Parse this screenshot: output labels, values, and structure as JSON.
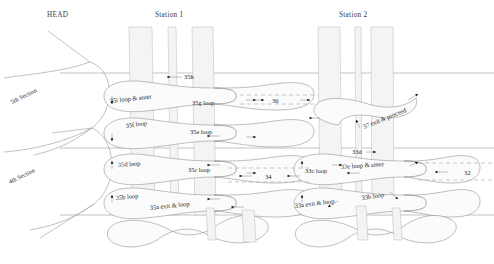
{
  "diagram": {
    "title_row": {
      "head": "HEAD",
      "station1": "Station 1",
      "station2": "Station 2"
    },
    "sections": [
      {
        "id": "sec5",
        "label": "5th Section"
      },
      {
        "id": "sec4",
        "label": "4th Section"
      }
    ],
    "station1_labels": [
      {
        "id": "s35h",
        "text": "35h"
      },
      {
        "id": "s35i",
        "text": "35i  loop & enter"
      },
      {
        "id": "s35g",
        "text": "35g  loop"
      },
      {
        "id": "s35f",
        "text": "35f  loop"
      },
      {
        "id": "s35e",
        "text": "35e  loop"
      },
      {
        "id": "s35d",
        "text": "35d  loop"
      },
      {
        "id": "s35c",
        "text": "35c  loop"
      },
      {
        "id": "s35b",
        "text": "35b  loop"
      },
      {
        "id": "s35a",
        "text": "35a  exit & loop"
      }
    ],
    "station2_labels": [
      {
        "id": "s37",
        "text": "37 exit & proceed"
      },
      {
        "id": "s33d",
        "text": "33d"
      },
      {
        "id": "s33c",
        "text": "33c loop"
      },
      {
        "id": "s33e",
        "text": "33e  loop & enter"
      },
      {
        "id": "s33b",
        "text": "33b  loop"
      },
      {
        "id": "s33a",
        "text": "33a  exit & loop"
      }
    ],
    "connectors": [
      {
        "id": "c36",
        "text": "36"
      },
      {
        "id": "c34",
        "text": "34"
      },
      {
        "id": "c32",
        "text": "32"
      }
    ],
    "colors": {
      "background": "#ffffff",
      "line": "#9a9a9a",
      "ribbon_fill": "#fbfbfb",
      "ribbon_stroke": "#8a8a8a",
      "column_fill": "#f4f4f4",
      "arrow": "#111111",
      "text": "#1d1d1d"
    }
  }
}
